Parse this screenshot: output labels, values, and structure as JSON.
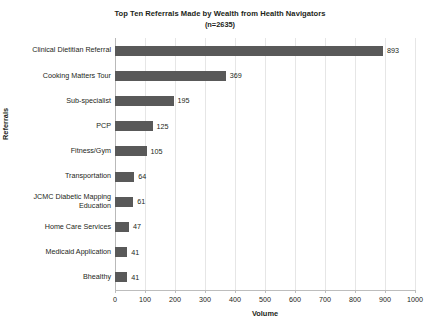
{
  "chart_data": {
    "type": "bar",
    "orientation": "horizontal",
    "title": "Top Ten Referrals Made by Wealth from Health Navigators",
    "subtitle": "(n=2635)",
    "xlabel": "Volume",
    "ylabel": "Referrals",
    "xlim": [
      0,
      1000
    ],
    "xticks": [
      0,
      100,
      200,
      300,
      400,
      500,
      600,
      700,
      800,
      900,
      1000
    ],
    "grid": "vertical",
    "legend": "none",
    "bar_color": "#595959",
    "gridline_color": "#e6e6e6",
    "axis_color": "#bdbdbd",
    "data_labels": true,
    "categories": [
      "Clinical Dietitian Referral",
      "Cooking Matters Tour",
      "Sub-specialist",
      "PCP",
      "Fitness/Gym",
      "Transportation",
      "JCMC Diabetic Mapping\nEducation",
      "Home Care Services",
      "Medicaid Application",
      "Bhealthy"
    ],
    "values": [
      893,
      369,
      195,
      125,
      105,
      64,
      61,
      47,
      41,
      41
    ],
    "value_labels": [
      "893",
      "369",
      "195",
      "125",
      "105",
      "64",
      "61",
      "47",
      "41",
      "41"
    ],
    "xtick_labels": [
      "0",
      "100",
      "200",
      "300",
      "400",
      "500",
      "600",
      "700",
      "800",
      "900",
      "1000"
    ]
  }
}
